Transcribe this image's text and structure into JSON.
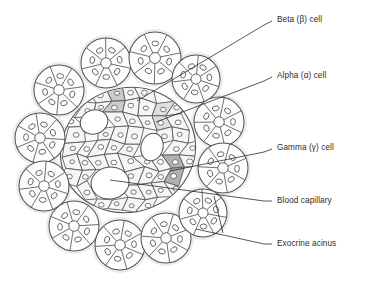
{
  "figure": {
    "background_color": "#ffffff",
    "line_color": "#555555",
    "text_color": "#2b2b2b",
    "islet_fill": "#fbfbfb",
    "acinus_halo_color": "#ececed",
    "capillary_fill": "#ffffff",
    "beta_cell_fill": "#cfcfcf",
    "alpha_cell_fill": "#dedede",
    "gamma_cell_fill": "#b4b4b4",
    "endocrine_cell_fill": "#f6f6f6",
    "nucleus_fill": "#ffffff"
  },
  "labels": [
    {
      "id": "beta",
      "text": "Beta (β) cell",
      "x": 277,
      "y": 15,
      "leader": [
        [
          272,
          21
        ],
        [
          264,
          25
        ],
        [
          137,
          101
        ]
      ]
    },
    {
      "id": "alpha",
      "text": "Alpha (α) cell",
      "x": 277,
      "y": 71,
      "leader": [
        [
          272,
          77
        ],
        [
          264,
          81
        ],
        [
          156,
          122
        ]
      ]
    },
    {
      "id": "gamma",
      "text": "Gamma (γ) cell",
      "x": 277,
      "y": 143,
      "leader": [
        [
          272,
          149
        ],
        [
          264,
          152
        ],
        [
          170,
          171
        ]
      ]
    },
    {
      "id": "capillary",
      "text": "Blood capillary",
      "x": 277,
      "y": 196,
      "leader": [
        [
          272,
          201
        ],
        [
          264,
          201
        ],
        [
          110,
          180
        ]
      ]
    },
    {
      "id": "acinus",
      "text": "Exocrine acinus",
      "x": 277,
      "y": 239,
      "leader": [
        [
          272,
          244
        ],
        [
          264,
          244
        ],
        [
          196,
          229
        ]
      ]
    }
  ],
  "acinus_fork": {
    "from": [
      264,
      244
    ],
    "joint": [
      223,
      233
    ],
    "branch_a": [
      196,
      229
    ],
    "branch_b": [
      214,
      196
    ]
  },
  "structures": {
    "islet": {
      "cx": 128,
      "cy": 150,
      "rx": 68,
      "ry": 62,
      "rotation": -18
    },
    "acini": [
      {
        "cx": 106,
        "cy": 63,
        "r": 25,
        "lobes": 7,
        "rot": 12
      },
      {
        "cx": 155,
        "cy": 58,
        "r": 26,
        "lobes": 7,
        "rot": 40
      },
      {
        "cx": 196,
        "cy": 79,
        "r": 24,
        "lobes": 7,
        "rot": 70
      },
      {
        "cx": 59,
        "cy": 90,
        "r": 25,
        "lobes": 7,
        "rot": 95
      },
      {
        "cx": 219,
        "cy": 122,
        "r": 25,
        "lobes": 7,
        "rot": 25
      },
      {
        "cx": 40,
        "cy": 138,
        "r": 25,
        "lobes": 7,
        "rot": 55
      },
      {
        "cx": 223,
        "cy": 168,
        "r": 25,
        "lobes": 7,
        "rot": 80
      },
      {
        "cx": 44,
        "cy": 186,
        "r": 25,
        "lobes": 7,
        "rot": 18
      },
      {
        "cx": 74,
        "cy": 226,
        "r": 25,
        "lobes": 7,
        "rot": 48
      },
      {
        "cx": 120,
        "cy": 245,
        "r": 25,
        "lobes": 7,
        "rot": 74
      },
      {
        "cx": 166,
        "cy": 238,
        "r": 25,
        "lobes": 7,
        "rot": 30
      },
      {
        "cx": 203,
        "cy": 213,
        "r": 24,
        "lobes": 7,
        "rot": 62
      }
    ],
    "capillaries": [
      {
        "cx": 94,
        "cy": 122,
        "rx": 14,
        "ry": 12,
        "rot": -20
      },
      {
        "cx": 152,
        "cy": 147,
        "rx": 11,
        "ry": 14,
        "rot": 15
      },
      {
        "cx": 110,
        "cy": 183,
        "rx": 19,
        "ry": 16,
        "rot": -8
      }
    ],
    "marked_cells": [
      {
        "id": "beta",
        "cx": 120,
        "cy": 98,
        "r": 11,
        "fill": "#cbcbcb"
      },
      {
        "id": "alpha",
        "cx": 160,
        "cy": 118,
        "r": 12,
        "fill": "#dedede"
      },
      {
        "id": "gamma",
        "cx": 174,
        "cy": 170,
        "r": 9,
        "fill": "#b0b0b0"
      }
    ]
  }
}
